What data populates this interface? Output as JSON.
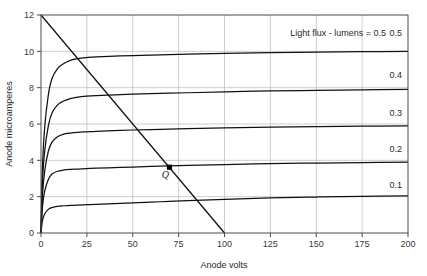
{
  "chart_data": {
    "type": "line",
    "title": "",
    "xlabel": "Anode volts",
    "ylabel": "Anode microamperes",
    "xlim": [
      0,
      200
    ],
    "ylim": [
      0,
      12
    ],
    "xticks": [
      0,
      25,
      50,
      75,
      100,
      125,
      150,
      175,
      200
    ],
    "yticks": [
      0,
      2,
      4,
      6,
      8,
      10,
      12
    ],
    "xtick_labels": [
      "0",
      "25",
      "50",
      "75",
      "100",
      "125",
      "150",
      "175",
      "200"
    ],
    "ytick_labels": [
      "0",
      "2",
      "4",
      "6",
      "8",
      "10",
      "12"
    ],
    "grid": true,
    "grid_color": "#b9b9b9",
    "legend_position": "inline-right",
    "annotation": "Light flux - lumens = 0.5",
    "series": [
      {
        "name": "0.5",
        "label": "0.5",
        "label_x": 200,
        "label_y": 10.85,
        "saturation": 9.65,
        "knee_volts": 22,
        "value_at_200": 10.0,
        "x": [
          0,
          0.8,
          2,
          4,
          6,
          9,
          12,
          16,
          20,
          25,
          30,
          40,
          50,
          65,
          80,
          100,
          125,
          150,
          175,
          200
        ],
        "y": [
          0,
          3.6,
          5.8,
          7.6,
          8.5,
          9.05,
          9.3,
          9.5,
          9.6,
          9.66,
          9.7,
          9.74,
          9.77,
          9.81,
          9.85,
          9.89,
          9.93,
          9.95,
          9.98,
          10.0
        ]
      },
      {
        "name": "0.4",
        "label": "0.4",
        "label_x": 200,
        "label_y": 8.55,
        "saturation": 7.5,
        "knee_volts": 22,
        "value_at_200": 7.9,
        "x": [
          0,
          0.8,
          2,
          4,
          6,
          9,
          12,
          16,
          20,
          25,
          30,
          40,
          50,
          65,
          80,
          100,
          125,
          150,
          175,
          200
        ],
        "y": [
          0,
          2.8,
          4.5,
          5.9,
          6.6,
          7.05,
          7.25,
          7.4,
          7.48,
          7.53,
          7.56,
          7.6,
          7.64,
          7.68,
          7.72,
          7.77,
          7.82,
          7.85,
          7.88,
          7.9
        ]
      },
      {
        "name": "0.3",
        "label": "0.3",
        "label_x": 200,
        "label_y": 6.45,
        "saturation": 5.55,
        "knee_volts": 18,
        "value_at_200": 5.9,
        "x": [
          0,
          0.8,
          2,
          4,
          6,
          9,
          12,
          16,
          20,
          25,
          30,
          40,
          50,
          65,
          80,
          100,
          125,
          150,
          175,
          200
        ],
        "y": [
          0,
          2.1,
          3.4,
          4.5,
          5.0,
          5.3,
          5.43,
          5.5,
          5.54,
          5.57,
          5.6,
          5.64,
          5.67,
          5.71,
          5.75,
          5.79,
          5.83,
          5.86,
          5.88,
          5.9
        ]
      },
      {
        "name": "0.2",
        "label": "0.2",
        "label_x": 200,
        "label_y": 4.45,
        "saturation": 3.5,
        "knee_volts": 14,
        "value_at_200": 3.9,
        "x": [
          0,
          0.8,
          2,
          4,
          6,
          9,
          12,
          16,
          20,
          25,
          30,
          40,
          50,
          65,
          80,
          100,
          125,
          150,
          175,
          200
        ],
        "y": [
          0,
          1.45,
          2.3,
          2.95,
          3.25,
          3.4,
          3.46,
          3.5,
          3.52,
          3.55,
          3.57,
          3.6,
          3.63,
          3.68,
          3.72,
          3.77,
          3.82,
          3.85,
          3.88,
          3.9
        ]
      },
      {
        "name": "0.1",
        "label": "0.1",
        "label_x": 200,
        "label_y": 2.45,
        "saturation": 1.5,
        "knee_volts": 10,
        "value_at_200": 2.05,
        "x": [
          0,
          0.8,
          2,
          4,
          6,
          9,
          12,
          16,
          20,
          25,
          30,
          40,
          50,
          65,
          80,
          100,
          125,
          150,
          175,
          200
        ],
        "y": [
          0,
          0.7,
          1.05,
          1.3,
          1.4,
          1.47,
          1.5,
          1.52,
          1.54,
          1.56,
          1.58,
          1.62,
          1.66,
          1.72,
          1.78,
          1.85,
          1.93,
          1.98,
          2.02,
          2.05
        ]
      }
    ],
    "load_line": {
      "name": "load-line",
      "from": [
        0,
        12
      ],
      "to": [
        100,
        0
      ]
    },
    "operating_point": {
      "label": "Q",
      "x": 70,
      "y": 3.62
    }
  }
}
